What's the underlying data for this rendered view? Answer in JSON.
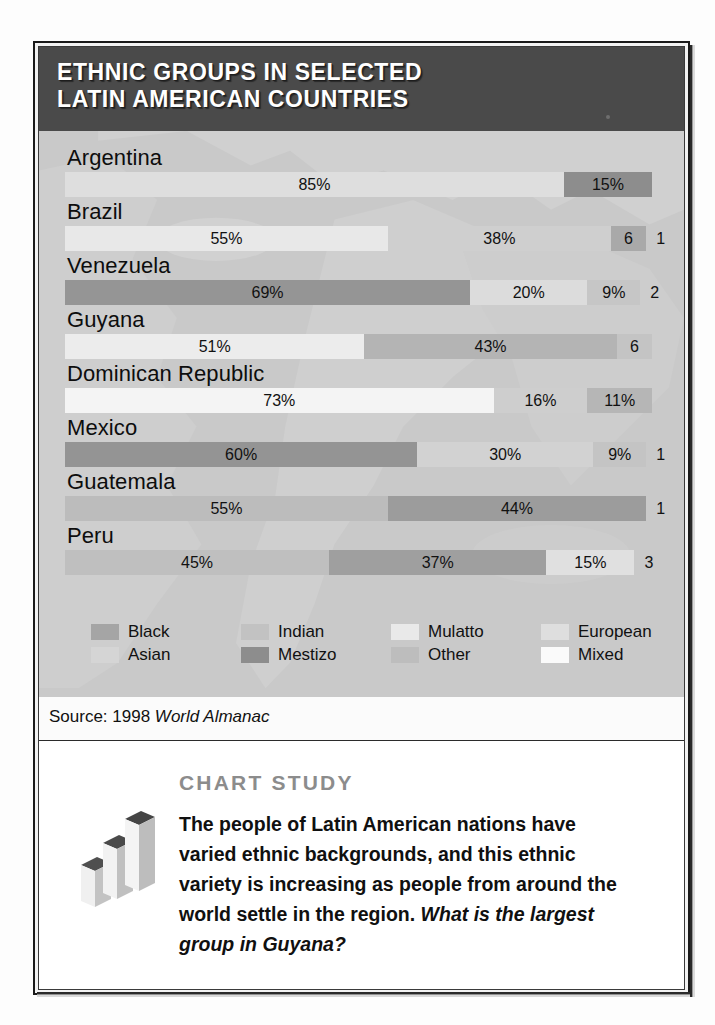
{
  "header": {
    "title": "ETHNIC GROUPS IN SELECTED\nLATIN AMERICAN COUNTRIES"
  },
  "source": {
    "prefix": "Source: 1998 ",
    "italic": "World Almanac"
  },
  "study": {
    "label_chart": "C",
    "label_chart_rest": "HART ",
    "label_study": "S",
    "label_study_rest": "TUDY",
    "title": "CHART STUDY",
    "body": "The people of Latin American nations have varied ethnic backgrounds, and this ethnic variety is increasing as people from around the world settle in the region. ",
    "question": "What is the largest group in Guyana?",
    "icon": "bar-chart-3d-icon"
  },
  "legend": {
    "items": [
      {
        "label": "Black",
        "color": "#a5a5a5"
      },
      {
        "label": "Asian",
        "color": "#d5d5d5"
      },
      {
        "label": "Indian",
        "color": "#c2c2c2"
      },
      {
        "label": "Mestizo",
        "color": "#8d8d8d"
      },
      {
        "label": "Mulatto",
        "color": "#e9e9e9"
      },
      {
        "label": "Other",
        "color": "#bdbdbd"
      },
      {
        "label": "European",
        "color": "#dedede"
      },
      {
        "label": "Mixed",
        "color": "#fafafa"
      }
    ]
  },
  "chart_data": {
    "type": "bar",
    "subtype": "stacked-horizontal-100",
    "title": "ETHNIC GROUPS IN SELECTED LATIN AMERICAN COUNTRIES",
    "xlabel": "",
    "ylabel": "",
    "xlim": [
      0,
      100
    ],
    "grid": false,
    "legend_position": "bottom",
    "source": "1998 World Almanac",
    "categories": [
      "Argentina",
      "Brazil",
      "Venezuela",
      "Guyana",
      "Dominican Republic",
      "Mexico",
      "Guatemala",
      "Peru"
    ],
    "rows": [
      {
        "country": "Argentina",
        "segments": [
          {
            "group": "European",
            "value": 85,
            "label": "85%",
            "color": "#dedede",
            "inside": true
          },
          {
            "group": "Mestizo",
            "value": 15,
            "label": "15%",
            "color": "#8d8d8d",
            "inside": true
          }
        ]
      },
      {
        "country": "Brazil",
        "segments": [
          {
            "group": "European",
            "value": 55,
            "label": "55%",
            "color": "#e8e8e8",
            "inside": true
          },
          {
            "group": "Mulatto",
            "value": 38,
            "label": "38%",
            "color": "#cfcfcf",
            "inside": true
          },
          {
            "group": "Black",
            "value": 6,
            "label": "6",
            "color": "#a9a9a9",
            "inside": true
          },
          {
            "group": "Other",
            "value": 1,
            "label": "1",
            "color": "#c9c9c9",
            "inside": false
          }
        ]
      },
      {
        "country": "Venezuela",
        "segments": [
          {
            "group": "Mestizo",
            "value": 69,
            "label": "69%",
            "color": "#959595",
            "inside": true
          },
          {
            "group": "European",
            "value": 20,
            "label": "20%",
            "color": "#dcdcdc",
            "inside": true
          },
          {
            "group": "Black",
            "value": 9,
            "label": "9%",
            "color": "#c6c6c6",
            "inside": true
          },
          {
            "group": "Indian",
            "value": 2,
            "label": "2",
            "color": "#c9c9c9",
            "inside": false
          }
        ]
      },
      {
        "country": "Guyana",
        "segments": [
          {
            "group": "Asian",
            "value": 51,
            "label": "51%",
            "color": "#ececec",
            "inside": true
          },
          {
            "group": "Black",
            "value": 43,
            "label": "43%",
            "color": "#b4b4b4",
            "inside": true
          },
          {
            "group": "Other",
            "value": 6,
            "label": "6",
            "color": "#c4c4c4",
            "inside": true
          }
        ]
      },
      {
        "country": "Dominican Republic",
        "segments": [
          {
            "group": "Mixed",
            "value": 73,
            "label": "73%",
            "color": "#f4f4f4",
            "inside": true
          },
          {
            "group": "Other",
            "value": 16,
            "label": "16%",
            "color": "#cecece",
            "inside": true
          },
          {
            "group": "Black",
            "value": 11,
            "label": "11%",
            "color": "#b6b6b6",
            "inside": true
          }
        ]
      },
      {
        "country": "Mexico",
        "segments": [
          {
            "group": "Mestizo",
            "value": 60,
            "label": "60%",
            "color": "#949494",
            "inside": true
          },
          {
            "group": "Indian",
            "value": 30,
            "label": "30%",
            "color": "#d2d2d2",
            "inside": true
          },
          {
            "group": "European",
            "value": 9,
            "label": "9%",
            "color": "#c4c4c4",
            "inside": true
          },
          {
            "group": "Other",
            "value": 1,
            "label": "1",
            "color": "#c9c9c9",
            "inside": false
          }
        ]
      },
      {
        "country": "Guatemala",
        "segments": [
          {
            "group": "Mestizo",
            "value": 55,
            "label": "55%",
            "color": "#bcbcbc",
            "inside": true
          },
          {
            "group": "Indian",
            "value": 44,
            "label": "44%",
            "color": "#9c9c9c",
            "inside": true
          },
          {
            "group": "Other",
            "value": 1,
            "label": "1",
            "color": "#c9c9c9",
            "inside": false
          }
        ]
      },
      {
        "country": "Peru",
        "segments": [
          {
            "group": "Indian",
            "value": 45,
            "label": "45%",
            "color": "#bfbfbf",
            "inside": true
          },
          {
            "group": "Mestizo",
            "value": 37,
            "label": "37%",
            "color": "#9f9f9f",
            "inside": true
          },
          {
            "group": "European",
            "value": 15,
            "label": "15%",
            "color": "#e0e0e0",
            "inside": true
          },
          {
            "group": "Other",
            "value": 3,
            "label": "3",
            "color": "#c9c9c9",
            "inside": false
          }
        ]
      }
    ]
  }
}
